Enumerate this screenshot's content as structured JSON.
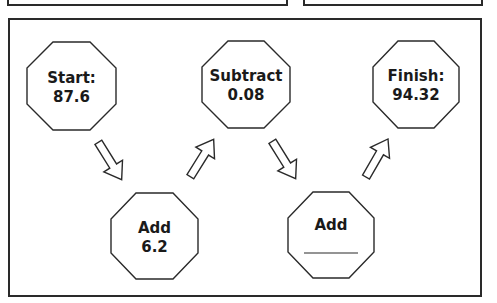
{
  "top_boxes": [
    {
      "id": "top-left-box"
    },
    {
      "id": "top-right-box"
    }
  ],
  "flow": {
    "nodes": [
      {
        "id": "start",
        "line1": "Start:",
        "line2": "87.6"
      },
      {
        "id": "step1",
        "line1": "Add",
        "line2": "6.2"
      },
      {
        "id": "step2",
        "line1": "Subtract",
        "line2": "0.08"
      },
      {
        "id": "step3",
        "line1": "Add",
        "line2": "",
        "blank": true
      },
      {
        "id": "finish",
        "line1": "Finish:",
        "line2": "94.32"
      }
    ],
    "arrows": [
      {
        "from": "start",
        "to": "step1",
        "direction": "down-right"
      },
      {
        "from": "step1",
        "to": "step2",
        "direction": "up-right"
      },
      {
        "from": "step2",
        "to": "step3",
        "direction": "down-right"
      },
      {
        "from": "step3",
        "to": "finish",
        "direction": "up-right"
      }
    ]
  },
  "colors": {
    "stroke": "#2a2a2a",
    "text": "#1a1a1a",
    "background": "#ffffff"
  }
}
